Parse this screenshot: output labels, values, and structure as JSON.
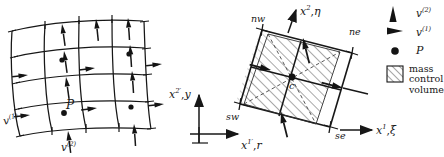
{
  "figure": {
    "kind": "two-panel-technical-diagram",
    "background_color": "#ffffff",
    "ink_color": "#1a1a1a",
    "hatch_color": "#5a5a5a"
  },
  "left_panel": {
    "name": "curvilinear-staggered-grid",
    "description": "4x4 curvilinear mesh with velocity component arrows on cell faces and pressure nodes at cell centers",
    "labels": {
      "point_P": "P",
      "velocity_1": "v",
      "velocity_1_sup": "(1)",
      "velocity_2": "v",
      "velocity_2_sup": "(2)"
    },
    "grid": {
      "rows": 4,
      "cols": 4,
      "node_count": 4,
      "arrow_vertical_label": "v(2)",
      "arrow_horizontal_label": "v(1)"
    }
  },
  "right_panel": {
    "name": "mass-control-volume-detail",
    "description": "Skewed hatched control volume cell with compass corner labels and centre node",
    "corners": {
      "nw": "nw",
      "ne": "ne",
      "sw": "sw",
      "se": "se"
    },
    "centre": "c",
    "axes": {
      "curvilinear_vertical": {
        "symbol": "x",
        "sup": "2",
        "comma": ",",
        "alt": "η"
      },
      "curvilinear_horizontal": {
        "symbol": "x",
        "sup": "1",
        "comma": ",",
        "alt": "ξ"
      },
      "cartesian_vertical": {
        "symbol": "x",
        "sup": "2′",
        "comma": ",",
        "alt": "y"
      },
      "cartesian_horizontal": {
        "symbol": "x",
        "sup": "1′",
        "comma": ",",
        "alt": "r"
      }
    }
  },
  "legend": {
    "name": "figure-legend",
    "items": [
      {
        "icon": "cone-arrow-up-icon",
        "label": "v",
        "sup": "(2)",
        "type": "symbol"
      },
      {
        "icon": "cone-arrow-right-icon",
        "label": "v",
        "sup": "(1)",
        "type": "symbol"
      },
      {
        "icon": "filled-dot-icon",
        "label": "P",
        "sup": "",
        "type": "symbol"
      },
      {
        "icon": "hatched-square-icon",
        "label": "mass\ncontrol\nvolume",
        "sup": "",
        "type": "area",
        "line1": "mass",
        "line2": "control",
        "line3": "volume"
      }
    ]
  }
}
